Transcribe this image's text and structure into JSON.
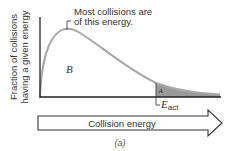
{
  "diagram": {
    "y_axis_label_line1": "Fraction of collisions",
    "y_axis_label_line2": "having a given energy",
    "peak_annotation_line1": "Most collisions are",
    "peak_annotation_line2": "of this energy.",
    "region_b_label": "B",
    "region_a_label": "A",
    "activation_label_main": "E",
    "activation_label_sub": "act",
    "x_arrow_label": "Collision energy",
    "panel_label": "(a)"
  },
  "colors": {
    "curve": "#a8a8a8",
    "axis": "#222222",
    "shaded_region": "#9a9a9a",
    "text": "#333333"
  }
}
